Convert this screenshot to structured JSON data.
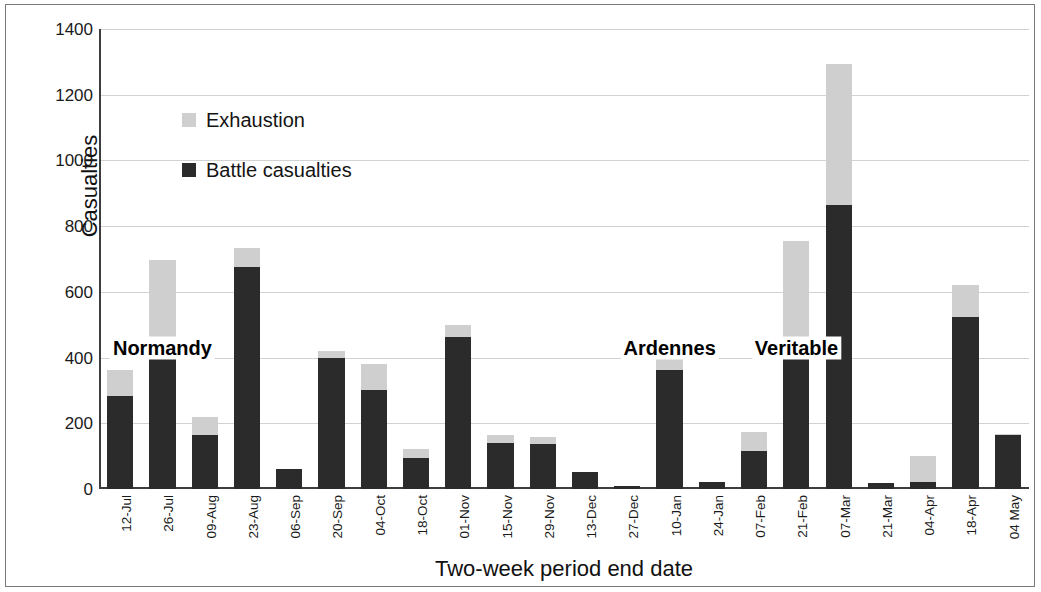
{
  "chart_data": {
    "type": "bar",
    "stacked": true,
    "title": "",
    "xlabel": "Two-week period end date",
    "ylabel": "Casualties",
    "ylim": [
      0,
      1400
    ],
    "ytick_step": 200,
    "yticks": [
      "1400",
      "1200",
      "1000",
      "800",
      "600",
      "400",
      "200",
      "0"
    ],
    "grid": true,
    "legend_position": "inside-upper-left",
    "colors": {
      "battle": "#2b2b2b",
      "exhaustion": "#cfcfcf",
      "axis": "#3d3d3d",
      "gridline": "#d2d2d2",
      "frame": "#7a7a7a"
    },
    "categories": [
      "12-Jul",
      "26-Jul",
      "09-Aug",
      "23-Aug",
      "06-Sep",
      "20-Sep",
      "04-Oct",
      "18-Oct",
      "01-Nov",
      "15-Nov",
      "29-Nov",
      "13-Dec",
      "27-Dec",
      "10-Jan",
      "24-Jan",
      "07-Feb",
      "21-Feb",
      "07-Mar",
      "21-Mar",
      "04-Apr",
      "18-Apr",
      "04 May"
    ],
    "series": [
      {
        "name": "Battle casualties",
        "color": "#2b2b2b",
        "values": [
          283,
          423,
          164,
          676,
          62,
          400,
          300,
          95,
          463,
          139,
          138,
          53,
          8,
          363,
          22,
          115,
          440,
          865,
          17,
          22,
          525,
          165
        ]
      },
      {
        "name": "Exhaustion",
        "color": "#cfcfcf",
        "values": [
          79,
          274,
          55,
          57,
          0,
          20,
          80,
          27,
          37,
          24,
          20,
          0,
          0,
          74,
          0,
          60,
          315,
          430,
          0,
          80,
          97,
          3
        ]
      }
    ],
    "totals": [
      362,
      697,
      219,
      733,
      62,
      420,
      380,
      122,
      500,
      163,
      158,
      53,
      8,
      437,
      22,
      175,
      755,
      1295,
      17,
      102,
      622,
      168
    ],
    "annotations": [
      {
        "text": "Normandy",
        "category": "26-Jul",
        "value": 430
      },
      {
        "text": "Ardennes",
        "category": "10-Jan",
        "value": 430
      },
      {
        "text": "Veritable",
        "category": "21-Feb",
        "value": 430
      }
    ]
  },
  "legend": {
    "items": [
      {
        "label": "Exhaustion",
        "color": "#cfcfcf"
      },
      {
        "label": "Battle casualties",
        "color": "#2b2b2b"
      }
    ]
  },
  "axes": {
    "y_title": "Casualties",
    "x_title": "Two-week period end date"
  }
}
